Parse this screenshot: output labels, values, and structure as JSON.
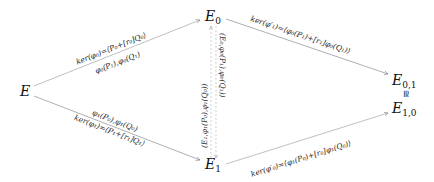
{
  "diagram": {
    "type": "commutative-diagram",
    "nodes": {
      "E": "E",
      "E0_base": "E",
      "E0_sub": "0",
      "E1_base": "E",
      "E1_sub": "1",
      "E01_base": "E",
      "E01_sub": "0,1",
      "E10_base": "E",
      "E10_sub": "1,0"
    },
    "iso_symbol": "≅",
    "edges": {
      "E_to_E0_top": "ker(φ₀)=⟨P₀+[r₀]Q₀⟩",
      "E_to_E0_bottom": "φ₀(P₁),φ₀(Q₁)",
      "E_to_E1_top": "φ₁(P₀),φ₁(Q₀)",
      "E_to_E1_bottom": "ker(φ₁)=⟨P₁+[r₁]Q₁⟩",
      "E0_to_E01": "ker(φ′₁)=⟨φ₀(P₁)+[r₁]φ₀(Q₁)⟩",
      "E1_to_E10": "ker(φ′₀)=⟨φ₁(P₀)+[r₀]φ₁(Q₀)⟩",
      "vertical_left": "(E₁,φ₁(P₀),φ₁(Q₀))",
      "vertical_right": "(E₀,φ₀(P₁),φ₀(Q₁))"
    },
    "colors": {
      "arrow": "#9a9a9a",
      "text": "#222222"
    }
  }
}
